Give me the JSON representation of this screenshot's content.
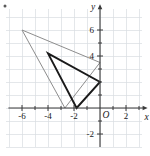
{
  "figure": {
    "kind": "coordinate-plane-with-two-triangles",
    "corner_mark": "•"
  },
  "chart_data": {
    "type": "scatter",
    "title": "",
    "subtitle": "",
    "xlabel": "x",
    "ylabel": "y",
    "xlim": [
      -7.2,
      3.2
    ],
    "ylim": [
      -3.0,
      7.6
    ],
    "grid": true,
    "grid_step": 1,
    "grid_color": "#d9dde1",
    "axis_color": "#3a3a3a",
    "legend": "none",
    "origin_label": "O",
    "xticks": [
      -6,
      -4,
      -2,
      2
    ],
    "xtick_labels": [
      "-6",
      "-4",
      "-2",
      "2"
    ],
    "yticks": [
      6,
      4,
      -2
    ],
    "ytick_labels": [
      "6",
      "4",
      "-2"
    ],
    "minor_tick_positions_x": [
      -5,
      -3,
      -1,
      1,
      3
    ],
    "minor_tick_positions_y": [
      5,
      3,
      2,
      1,
      -1
    ],
    "series": [
      {
        "name": "image-triangle-gray",
        "type": "polygon",
        "color": "#8d8d8d",
        "stroke_width": 1.0,
        "closed": true,
        "points": [
          [
            -6,
            6
          ],
          [
            -2.7,
            0
          ],
          [
            0,
            3.5
          ]
        ],
        "vertex_labels": [
          "(-6, 6)",
          "(-2.7, 0)",
          "(0, 3.5)"
        ]
      },
      {
        "name": "preimage-triangle-black",
        "type": "polygon",
        "color": "#1a1a1a",
        "stroke_width": 1.9,
        "closed": true,
        "points": [
          [
            -4,
            4.2
          ],
          [
            -1.8,
            0
          ],
          [
            0,
            2
          ]
        ],
        "vertex_labels": [
          "(-4, 4.2)",
          "(-1.8, 0)",
          "(0, 2)"
        ]
      }
    ]
  }
}
